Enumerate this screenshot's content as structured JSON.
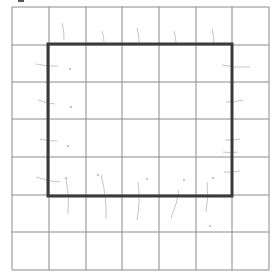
{
  "grid": {
    "columns": 7,
    "rows": 7,
    "x_lines": [
      12,
      49,
      86,
      122,
      159,
      196,
      232,
      269
    ],
    "y_lines": [
      7,
      45,
      82,
      119,
      157,
      195,
      232,
      270
    ],
    "line_color": "#8a8a8a"
  },
  "outline": {
    "label": "rectangle",
    "x": 48,
    "y": 44,
    "width": 184,
    "height": 152,
    "stroke_color": "#3a3a3a",
    "stroke_width": 3
  },
  "pencil_marks": {
    "color": "#b8b8b8",
    "top": [
      {
        "x": 64,
        "y1": 23,
        "y2": 40
      },
      {
        "x": 104,
        "y1": 31,
        "y2": 42
      },
      {
        "x": 139,
        "y1": 28,
        "y2": 42
      },
      {
        "x": 176,
        "y1": 31,
        "y2": 44
      },
      {
        "x": 214,
        "y1": 29,
        "y2": 44
      }
    ],
    "left": [
      {
        "x1": 36,
        "y1": 64,
        "x2": 58,
        "y2": 66
      },
      {
        "x1": 38,
        "y1": 100,
        "x2": 55,
        "y2": 104
      },
      {
        "x1": 40,
        "y1": 139,
        "x2": 57,
        "y2": 141
      },
      {
        "x1": 36,
        "y1": 177,
        "x2": 60,
        "y2": 182
      }
    ],
    "right": [
      {
        "x1": 222,
        "y1": 65,
        "x2": 250,
        "y2": 67
      },
      {
        "x1": 226,
        "y1": 102,
        "x2": 243,
        "y2": 100
      },
      {
        "x1": 225,
        "y1": 140,
        "x2": 240,
        "y2": 139
      },
      {
        "x1": 224,
        "y1": 172,
        "x2": 240,
        "y2": 171
      },
      {
        "x1": 223,
        "y1": 152,
        "x2": 238,
        "y2": 152
      }
    ],
    "bottom": [
      {
        "x1": 66,
        "y1": 178,
        "x2": 68,
        "y2": 214
      },
      {
        "x1": 101,
        "y1": 175,
        "x2": 106,
        "y2": 219
      },
      {
        "x1": 138,
        "y1": 182,
        "x2": 137,
        "y2": 220
      },
      {
        "x1": 179,
        "y1": 190,
        "x2": 171,
        "y2": 218
      },
      {
        "x1": 207,
        "y1": 182,
        "x2": 206,
        "y2": 212
      }
    ],
    "dots": [
      {
        "x": 70,
        "y": 69
      },
      {
        "x": 71,
        "y": 107
      },
      {
        "x": 68,
        "y": 146
      },
      {
        "x": 66,
        "y": 178
      },
      {
        "x": 98,
        "y": 175
      },
      {
        "x": 147,
        "y": 179
      },
      {
        "x": 184,
        "y": 180
      },
      {
        "x": 213,
        "y": 178
      },
      {
        "x": 210,
        "y": 226
      }
    ]
  }
}
